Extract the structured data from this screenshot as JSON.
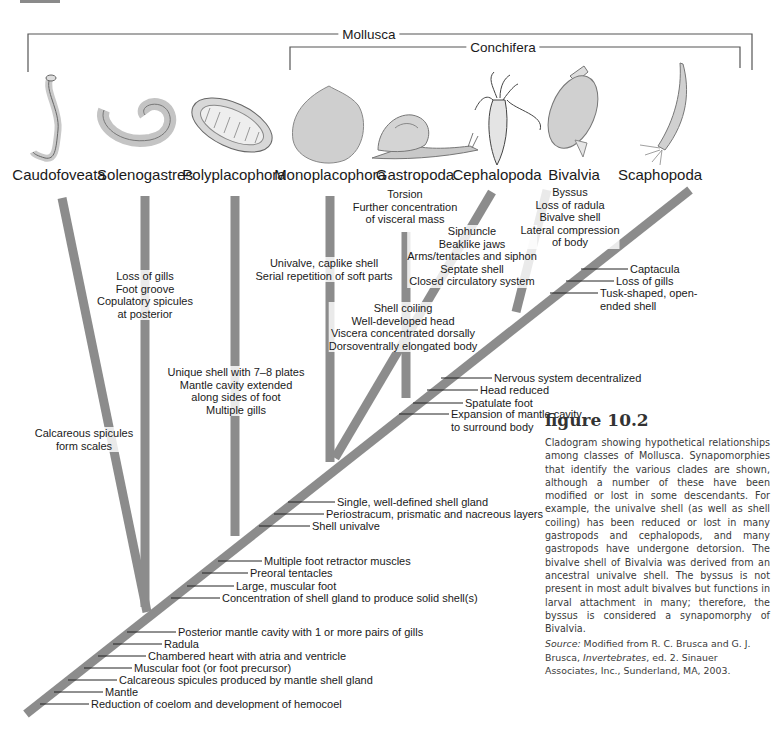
{
  "figure": {
    "title": "figure 10.2",
    "caption": "Cladogram showing hypothetical relationships among classes of Mollusca. Synapomorphies that identify the various clades are shown, although a number of these have been modified or lost in some descendants. For example, the univalve shell (as well as shell coiling) has been reduced or lost in many gastropods and cephalopods, and many gastropods have undergone detorsion. The bivalve shell of Bivalvia was derived from an ancestral univalve shell. The byssus is not present in most adult bivalves but functions in larval attachment in many; therefore, the byssus is considered a synapomorphy of Bivalvia.",
    "source_label": "Source:",
    "source_text_1": " Modified from R. C. Brusca and G. J. Brusca, ",
    "source_book": "Invertebrates",
    "source_text_2": ", ed. 2. Sinauer Associates, Inc., Sunderland, MA, 2003."
  },
  "brackets": {
    "mollusca": "Mollusca",
    "conchifera": "Conchifera"
  },
  "taxa": [
    {
      "name": "Caudofoveata",
      "icon": "worm-caudofoveata-illustration"
    },
    {
      "name": "Solenogastres",
      "icon": "worm-solenogastres-illustration"
    },
    {
      "name": "Polyplacophora",
      "icon": "chiton-illustration"
    },
    {
      "name": "Monoplacophora",
      "icon": "cap-shell-illustration"
    },
    {
      "name": "Gastropoda",
      "icon": "snail-illustration"
    },
    {
      "name": "Cephalopoda",
      "icon": "squid-illustration"
    },
    {
      "name": "Bivalvia",
      "icon": "clam-illustration"
    },
    {
      "name": "Scaphopoda",
      "icon": "tusk-shell-illustration"
    }
  ],
  "branch_traits": {
    "caudofoveata": [
      "Calcareous spicules",
      "form scales"
    ],
    "solenogastres": [
      "Loss of gills",
      "Foot groove",
      "Copulatory spicules",
      "at posterior"
    ],
    "polyplacophora": [
      "Unique shell with 7–8 plates",
      "Mantle cavity extended",
      "along sides of foot",
      "Multiple gills"
    ],
    "monoplacophora": [
      "Univalve, caplike shell",
      "Serial repetition of soft parts"
    ],
    "gastropoda": [
      "Torsion",
      "Further concentration",
      "of visceral mass"
    ],
    "gastro_cephalo": [
      "Shell coiling",
      "Well-developed head",
      "Viscera concentrated dorsally",
      "Dorsoventrally elongated body"
    ],
    "cephalopoda": [
      "Siphuncle",
      "Beaklike jaws",
      "Arms/tentacles and siphon",
      "Septate shell",
      "Closed circulatory system"
    ],
    "bivalvia": [
      "Byssus",
      "Loss of radula",
      "Bivalve shell",
      "Lateral compression",
      "of body"
    ]
  },
  "stem_traits": {
    "scaphopoda": [
      "Captacula",
      "Loss of gills",
      "Tusk-shaped, open-",
      "ended shell"
    ],
    "diasoma": [
      "Nervous system decentralized",
      "Head reduced",
      "Spatulate foot",
      "Expansion of mantle cavity",
      "to surround body"
    ],
    "conchifera": [
      "Single, well-defined shell gland",
      "Periostracum, prismatic and nacreous layers",
      "Shell univalve"
    ],
    "testaria": [
      "Multiple foot retractor muscles",
      "Preoral tentacles",
      "Large, muscular foot",
      "Concentration of shell gland to produce solid shell(s)"
    ],
    "mollusca": [
      "Posterior mantle cavity with 1 or more pairs of gills",
      "Radula",
      "Chambered heart with atria and ventricle",
      "Muscular foot (or foot precursor)",
      "Calcareous spicules produced by mantle shell gland",
      "Mantle",
      "Reduction of coelom and development of hemocoel"
    ]
  },
  "colors": {
    "branch": "#8c8c8c",
    "text": "#1a1a1a",
    "caption_text": "#3a3a3a"
  }
}
